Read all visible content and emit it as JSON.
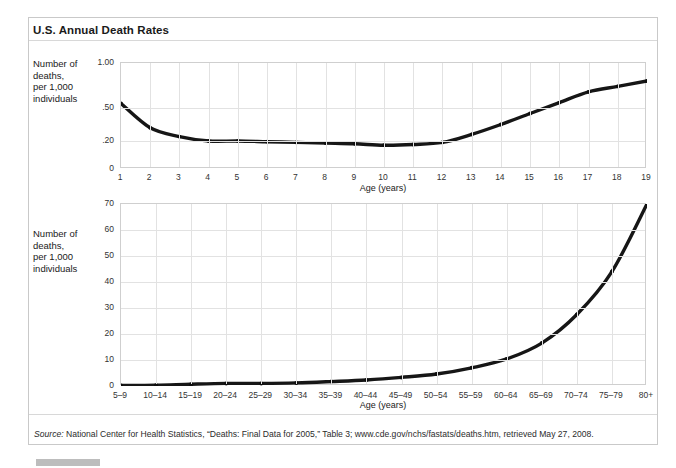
{
  "title": "U.S. Annual Death Rates",
  "side_label": "Number of\ndeaths,\nper 1,000\nindividuals",
  "source": {
    "prefix": "Source:",
    "text": " National Center for Health Statistics, “Deaths: Final Data for 2005,” Table 3; www.cde.gov/nchs/fastats/deaths.htm, retrieved May 27, 2008."
  },
  "chart_data": [
    {
      "type": "line",
      "title": "U.S. Annual Death Rates",
      "subtitle": "Ages 1 to 19",
      "xlabel": "Age (years)",
      "ylabel": "Number of deaths, per 1,000 individuals",
      "grid": true,
      "legend": "none",
      "x": [
        1,
        2,
        3,
        4,
        5,
        6,
        7,
        8,
        9,
        10,
        11,
        12,
        13,
        14,
        15,
        16,
        17,
        18,
        19
      ],
      "categories": [
        "1",
        "2",
        "3",
        "4",
        "5",
        "6",
        "7",
        "8",
        "9",
        "10",
        "11",
        "12",
        "13",
        "14",
        "15",
        "16",
        "17",
        "18",
        "19"
      ],
      "values": [
        0.55,
        0.32,
        0.24,
        0.2,
        0.2,
        0.195,
        0.19,
        0.185,
        0.18,
        0.17,
        0.175,
        0.19,
        0.26,
        0.35,
        0.45,
        0.56,
        0.68,
        0.74,
        0.8
      ],
      "xlim": [
        1,
        19
      ],
      "ylim": [
        0,
        1.0
      ],
      "ytick_labels": [
        "1.00",
        ".50",
        ".20",
        "0"
      ],
      "ytick_values": [
        1.0,
        0.5,
        0.2,
        0
      ],
      "yaxis_scale": "non-linear",
      "xtick_labels": [
        "1",
        "2",
        "3",
        "4",
        "5",
        "6",
        "7",
        "8",
        "9",
        "10",
        "11",
        "12",
        "13",
        "14",
        "15",
        "16",
        "17",
        "18",
        "19"
      ]
    },
    {
      "type": "line",
      "title": "U.S. Annual Death Rates",
      "subtitle": "Ages 5–9 to 80+",
      "xlabel": "Age (years)",
      "ylabel": "Number of deaths, per 1,000 individuals",
      "grid": true,
      "legend": "none",
      "categories": [
        "5–9",
        "10–14",
        "15–19",
        "20–24",
        "25–29",
        "30–34",
        "35–39",
        "40–44",
        "45–49",
        "50–54",
        "55–59",
        "60–64",
        "65–69",
        "70–74",
        "75–79",
        "80+"
      ],
      "values": [
        0.2,
        0.3,
        0.7,
        1.0,
        1.0,
        1.2,
        1.7,
        2.3,
        3.3,
        4.6,
        7.0,
        10.4,
        16.5,
        27.5,
        44.0,
        70.0
      ],
      "xlim": [
        0,
        15
      ],
      "ylim": [
        0,
        70
      ],
      "ytick_labels": [
        "0",
        "10",
        "20",
        "30",
        "40",
        "50",
        "60",
        "70"
      ],
      "ytick_values": [
        0,
        10,
        20,
        30,
        40,
        50,
        60,
        70
      ],
      "yaxis_scale": "linear",
      "xtick_labels": [
        "5–9",
        "10–14",
        "15–19",
        "20–24",
        "25–29",
        "30–34",
        "35–39",
        "40–44",
        "45–49",
        "50–54",
        "55–59",
        "60–64",
        "65–69",
        "70–74",
        "75–79",
        "80+"
      ]
    }
  ]
}
